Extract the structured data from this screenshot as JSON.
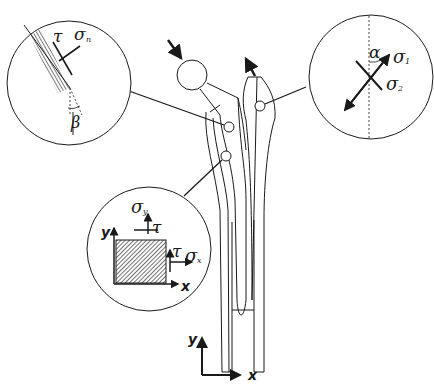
{
  "diagram": {
    "colors": {
      "stroke": "#1a1a1a",
      "background": "#ffffff"
    },
    "global_axes": {
      "x_label": "x",
      "y_label": "y"
    },
    "detail_left": {
      "labels": {
        "tau": "τ",
        "sigma": "σ",
        "sigma_sub": "n",
        "angle": "β"
      }
    },
    "detail_right": {
      "labels": {
        "angle": "α",
        "sigma1": "σ",
        "sigma1_sub": "1",
        "sigma2": "σ",
        "sigma2_sub": "2"
      }
    },
    "detail_bottom": {
      "labels": {
        "y": "y",
        "x": "x",
        "sigma_y": "σ",
        "sigma_y_sub": "y",
        "tau_top": "τ",
        "tau_right": "τ",
        "sigma_x": "σ",
        "sigma_x_sub": "x"
      }
    }
  }
}
